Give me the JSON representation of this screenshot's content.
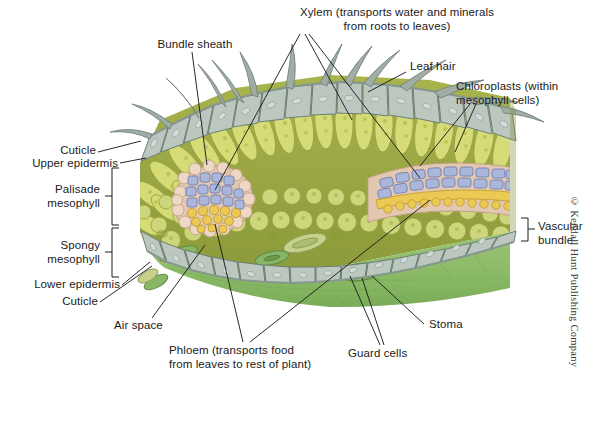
{
  "figure": {
    "credit": "© Kendall Hunt Publishing Company"
  },
  "labels": {
    "bundle_sheath": "Bundle sheath",
    "xylem": "Xylem (transports water and minerals\nfrom roots to leaves)",
    "leaf_hair": "Leaf hair",
    "chloroplasts": "Chloroplasts (within\nmesophyll cells)",
    "cuticle_top": "Cuticle",
    "upper_epidermis": "Upper epidermis",
    "palisade_mesophyll": "Palisade\nmesophyll",
    "spongy_mesophyll": "Spongy\nmesophyll",
    "lower_epidermis": "Lower epidermis",
    "cuticle_bottom": "Cuticle",
    "vascular_bundle": "Vascular\nbundle",
    "air_space": "Air space",
    "phloem": "Phloem (transports food\nfrom leaves to rest of plant)",
    "guard_cells": "Guard cells",
    "stoma": "Stoma"
  },
  "colors": {
    "background": "#ffffff",
    "label_text": "#1a1a1a",
    "leader_line": "#1d1d1d",
    "epidermis_fill": "#b9c4bd",
    "epidermis_stroke": "#6d7f76",
    "cuticle": "#8c9d93",
    "leaf_hair": "#9aa9a0",
    "palisade_fill": "#d3d972",
    "palisade_stroke": "#9aa33f",
    "mesophyll_ground": "#93a23f",
    "spongy_fill": "#cbd47a",
    "chloroplast_dot": "#a8b24a",
    "bundle_sheath_fill": "#e0c4ae",
    "bundle_sheath_stroke": "#b99madeup",
    "xylem_fill": "#a7b4d8",
    "xylem_stroke": "#6f7eb0",
    "phloem_fill": "#e9c752",
    "phloem_stroke": "#bb9a2a",
    "lower_surface": "#8fbc6a",
    "lower_surface_dark": "#6f9e4e",
    "stoma_line": "#5f8a45"
  },
  "structures": [
    {
      "name": "cuticle",
      "description": "thin waxy layer covering epidermis"
    },
    {
      "name": "upper-epidermis",
      "description": "single row of gray-green cells on top"
    },
    {
      "name": "leaf-hairs",
      "description": "curved trichomes projecting from upper epidermis"
    },
    {
      "name": "palisade-mesophyll",
      "description": "column of elongated chloroplast-rich cells"
    },
    {
      "name": "spongy-mesophyll",
      "description": "rounded loosely packed cells with air spaces"
    },
    {
      "name": "air-space",
      "description": "gaps between spongy mesophyll cells"
    },
    {
      "name": "vascular-bundle",
      "description": "xylem above, phloem below, ringed by bundle sheath"
    },
    {
      "name": "lower-epidermis",
      "description": "single row of cells on underside"
    },
    {
      "name": "stoma",
      "description": "pore in lower epidermis for gas exchange"
    },
    {
      "name": "guard-cells",
      "description": "paired cells flanking each stoma"
    }
  ]
}
